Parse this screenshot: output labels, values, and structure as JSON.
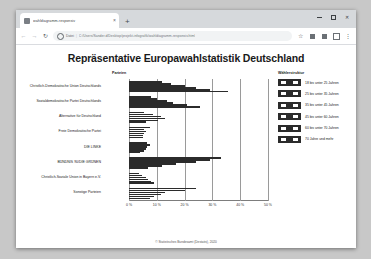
{
  "browser": {
    "tab": {
      "title": "wahldiagramm-responsiv",
      "close_label": "×",
      "favicon": "page-icon"
    },
    "new_tab_label": "+",
    "window_controls": {
      "minimize": "–",
      "maximize": "□",
      "close": "✕"
    },
    "nav": {
      "back": "←",
      "forward": "→",
      "reload": "↻"
    },
    "omnibox": {
      "scheme_label": "Datei",
      "separator": "|",
      "url": "C:/Users/Sander.d/Desktop/projekt-infografik/wahldiagramm-responsiv.html",
      "security_icon": "info-circle-icon"
    },
    "toolbar_icons": [
      "star-icon",
      "extension-icon",
      "apps-icon",
      "profile-icon",
      "menu-kebab-icon"
    ],
    "menu_label": "⋮",
    "star_label": "☆"
  },
  "page": {
    "title": "Repräsentative Europawahlstatistik Deutschland",
    "column_header": "Parteien",
    "footer": "© Statistisches Bundesamt (Destatis), 2020"
  },
  "legend": {
    "title": "Wählerstruktur",
    "items": [
      "18 bis unter 25 Jahren",
      "25 bis unter 35 Jahren",
      "35 bis unter 45 Jahren",
      "45 bis unter 60 Jahren",
      "60 bis unter 70 Jahren",
      "70 Jahre und mehr"
    ]
  },
  "chart_data": {
    "type": "bar",
    "orientation": "horizontal",
    "title": "Repräsentative Europawahlstatistik Deutschland",
    "xlabel": "",
    "ylabel": "Parteien",
    "xlim": [
      0,
      50
    ],
    "xticks": [
      0,
      10,
      20,
      30,
      40,
      50
    ],
    "xticklabels": [
      "0 %",
      "10 %",
      "20 %",
      "30 %",
      "40 %",
      "50 %"
    ],
    "grid": true,
    "legend_position": "right",
    "categories": [
      "Christlich-Demokratische Union Deutschlands",
      "Sozialdemokratische Partei Deutschlands",
      "Alternative für Deutschland",
      "Freie Demokratische Partei",
      "DIE LINKE",
      "BÜNDNIS 90/DIE GRÜNEN",
      "Christlich-Soziale Union in Bayern e.V.",
      "Sonstige Parteien"
    ],
    "series": [
      {
        "name": "18 bis unter 25 Jahren",
        "values": [
          12.0,
          8.0,
          5.5,
          7.5,
          6.5,
          33.0,
          3.5,
          24.0
        ]
      },
      {
        "name": "25 bis unter 35 Jahren",
        "values": [
          15.0,
          10.0,
          8.5,
          5.5,
          7.5,
          29.0,
          4.5,
          20.0
        ]
      },
      {
        "name": "35 bis unter 45 Jahren",
        "values": [
          20.0,
          13.5,
          11.5,
          6.0,
          6.5,
          24.0,
          6.0,
          13.0
        ]
      },
      {
        "name": "45 bis unter 60 Jahren",
        "values": [
          24.0,
          16.0,
          13.0,
          5.5,
          6.0,
          17.0,
          7.0,
          11.5
        ]
      },
      {
        "name": "60 bis unter 70 Jahren",
        "values": [
          29.0,
          21.0,
          10.5,
          5.0,
          5.5,
          12.0,
          8.0,
          9.0
        ]
      },
      {
        "name": "70 Jahre und mehr",
        "values": [
          35.5,
          25.5,
          6.0,
          5.0,
          4.0,
          7.0,
          9.0,
          7.5
        ]
      }
    ]
  }
}
